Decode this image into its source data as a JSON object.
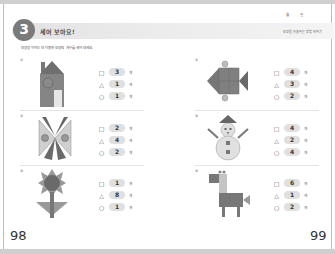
{
  "header": {
    "unit_number": "3",
    "title": "세어 보아요!",
    "instruction": "모양을 이어는 데 이용한 모양의 개수를 세어 보세요.",
    "right_labels": [
      "월",
      "일"
    ],
    "right_subtitle": "모양을 이용하는 방법 익히기"
  },
  "pages": {
    "left": "98",
    "right": "99"
  },
  "symbols": {
    "square": "□",
    "triangle": "△",
    "circle": "○"
  },
  "unit_label": "개",
  "problems": [
    {
      "id": "1",
      "figure": "house",
      "square": "3",
      "triangle": "1",
      "circle": "1"
    },
    {
      "id": "2",
      "figure": "bowtie",
      "square": "2",
      "triangle": "4",
      "circle": "2"
    },
    {
      "id": "3",
      "figure": "flower",
      "square": "1",
      "triangle": "8",
      "circle": "1"
    },
    {
      "id": "4",
      "figure": "fish",
      "square": "4",
      "triangle": "3",
      "circle": "2"
    },
    {
      "id": "5",
      "figure": "snowman",
      "square": "4",
      "triangle": "2",
      "circle": "4"
    },
    {
      "id": "6",
      "figure": "giraffe",
      "square": "6",
      "triangle": "1",
      "circle": "2"
    }
  ]
}
